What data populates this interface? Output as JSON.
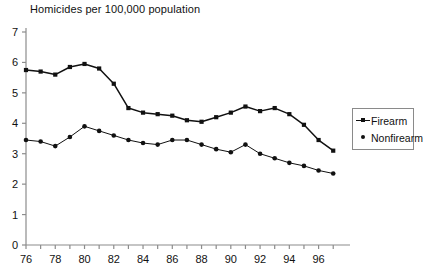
{
  "chart_data": {
    "type": "line",
    "title": "Homicides per 100,000 population",
    "xlabel": "",
    "ylabel": "",
    "xlim": [
      1976,
      1997.6
    ],
    "ylim": [
      0,
      7
    ],
    "ytick_step": 1,
    "xtick_step": 1,
    "xtick_label_step": 2,
    "grid": false,
    "legend_position": "right",
    "x": [
      1976,
      1977,
      1978,
      1979,
      1980,
      1981,
      1982,
      1983,
      1984,
      1985,
      1986,
      1987,
      1988,
      1989,
      1990,
      1991,
      1992,
      1993,
      1994,
      1995,
      1996,
      1997
    ],
    "xtick_labels": [
      "76",
      "",
      "78",
      "",
      "80",
      "",
      "82",
      "",
      "84",
      "",
      "86",
      "",
      "88",
      "",
      "90",
      "",
      "92",
      "",
      "94",
      "",
      "96",
      ""
    ],
    "ytick_labels": [
      "0",
      "1",
      "2",
      "3",
      "4",
      "5",
      "6",
      "7"
    ],
    "series": [
      {
        "name": "Firearm",
        "marker": "square",
        "color": "#111111",
        "values": [
          5.75,
          5.7,
          5.6,
          5.85,
          5.95,
          5.8,
          5.3,
          4.5,
          4.35,
          4.3,
          4.25,
          4.1,
          4.05,
          4.2,
          4.35,
          4.55,
          4.4,
          4.5,
          4.3,
          3.95,
          3.45,
          3.1
        ]
      },
      {
        "name": "Nonfirearm",
        "marker": "circle",
        "color": "#111111",
        "values": [
          3.45,
          3.4,
          3.25,
          3.55,
          3.9,
          3.75,
          3.6,
          3.45,
          3.35,
          3.3,
          3.45,
          3.45,
          3.3,
          3.15,
          3.05,
          3.3,
          3.0,
          2.85,
          2.7,
          2.6,
          2.45,
          2.35
        ]
      }
    ]
  },
  "legend": {
    "items": [
      {
        "label": "Firearm"
      },
      {
        "label": "Nonfirearm"
      }
    ]
  }
}
